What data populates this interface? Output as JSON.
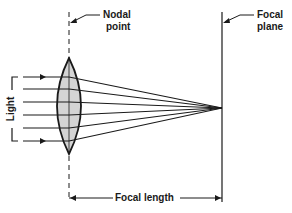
{
  "diagram": {
    "labels": {
      "nodal_point": [
        "Nodal",
        "point"
      ],
      "focal_plane": [
        "Focal",
        "plane"
      ],
      "light": "Light",
      "focal_length": "Focal length"
    },
    "colors": {
      "line": "#1a1a1a",
      "lens_fill": "#d4d4d4",
      "background": "#ffffff"
    },
    "rays_count": 6
  }
}
